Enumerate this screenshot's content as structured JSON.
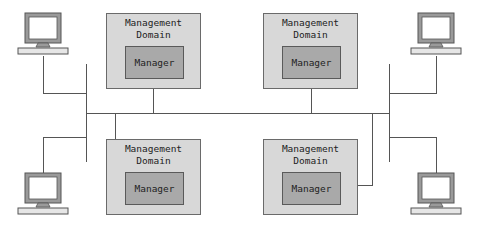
{
  "diagram": {
    "type": "network-topology",
    "domains": [
      {
        "id": "top-left",
        "title": "Management\nDomain",
        "manager_label": "Manager"
      },
      {
        "id": "top-right",
        "title": "Management\nDomain",
        "manager_label": "Manager"
      },
      {
        "id": "bottom-left",
        "title": "Management\nDomain",
        "manager_label": "Manager"
      },
      {
        "id": "bottom-right",
        "title": "Management\nDomain",
        "manager_label": "Manager"
      }
    ],
    "workstations": [
      {
        "id": "top-left",
        "icon": "computer-icon"
      },
      {
        "id": "top-right",
        "icon": "computer-icon"
      },
      {
        "id": "bottom-left",
        "icon": "computer-icon"
      },
      {
        "id": "bottom-right",
        "icon": "computer-icon"
      }
    ],
    "colors": {
      "domain_fill": "#d8d8d8",
      "manager_fill": "#a9a9a9",
      "line": "#555555",
      "monitor": "#9a9a9a"
    }
  }
}
